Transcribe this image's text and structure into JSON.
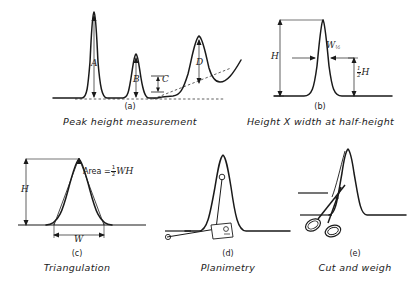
{
  "figure": {
    "background": "#ffffff",
    "ink": "#1a1a1a"
  },
  "panels": [
    {
      "id": "(a)",
      "caption": "Peak height measurement",
      "labels": [
        "A",
        "B",
        "C",
        "D"
      ],
      "description": "Chromatogram with four peaks, baselines drawn as dashed construction lines and peak heights marked by vertical arrows"
    },
    {
      "id": "(b)",
      "caption": "Height X width at half-height",
      "labels": [
        "H",
        "W",
        "1",
        "2",
        "H"
      ],
      "height_label": "H",
      "width_label": "W",
      "width_subscript": "½",
      "half_height_numerator": "1",
      "half_height_denominator": "2",
      "half_height_symbol": "H",
      "description": "Single gaussian peak with total height H and width W measured at one half of H"
    },
    {
      "id": "(c)",
      "caption": "Triangulation",
      "height_label": "H",
      "width_label": "W",
      "formula_prefix": "Area =",
      "formula_numerator": "1",
      "formula_denominator": "2",
      "formula_suffix": "WH",
      "description": "Peak with tangents drawn to the inflection points forming a triangle of base W and height H"
    },
    {
      "id": "(d)",
      "caption": "Planimetry",
      "description": "Mechanical planimeter tracing the outline of a chromatographic peak"
    },
    {
      "id": "(e)",
      "caption": "Cut and weigh",
      "description": "Scissors cutting the peak out of the chart paper for gravimetric measurement"
    }
  ]
}
